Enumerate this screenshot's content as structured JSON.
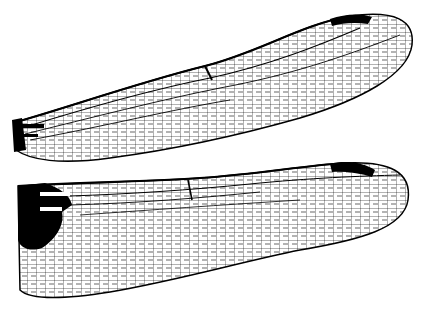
{
  "figure": {
    "wings": [
      {
        "name": "forewing",
        "pterostigma_color": "#000000"
      },
      {
        "name": "hindwing",
        "pterostigma_color": "#000000",
        "basal_patch_color": "#000000"
      }
    ],
    "caption": ""
  },
  "colors": {
    "ink": "#000000",
    "background": "#ffffff"
  }
}
